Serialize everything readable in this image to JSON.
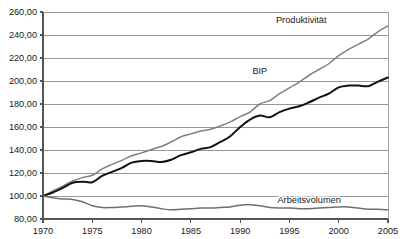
{
  "chart_data": {
    "type": "line",
    "title": "",
    "subtitle": "",
    "xlabel": "",
    "ylabel": "",
    "xlim": [
      1970,
      2005
    ],
    "ylim": [
      80,
      260
    ],
    "grid": true,
    "legend_position": "inline-annotations",
    "y_ticks": [
      80,
      100,
      120,
      140,
      160,
      180,
      200,
      220,
      240,
      260
    ],
    "y_tick_labels": [
      "80,00",
      "100,00",
      "120,00",
      "140,00",
      "160,00",
      "180,00",
      "200,00",
      "220,00",
      "240,00",
      "260,00"
    ],
    "x_ticks": [
      1970,
      1975,
      1980,
      1985,
      1990,
      1995,
      2000,
      2005
    ],
    "x_tick_labels": [
      "1970",
      "1975",
      "1980",
      "1985",
      "1990",
      "1995",
      "2000",
      "2005"
    ],
    "x": [
      1970,
      1971,
      1972,
      1973,
      1974,
      1975,
      1976,
      1977,
      1978,
      1979,
      1980,
      1981,
      1982,
      1983,
      1984,
      1985,
      1986,
      1987,
      1988,
      1989,
      1990,
      1991,
      1992,
      1993,
      1994,
      1995,
      1996,
      1997,
      1998,
      1999,
      2000,
      2001,
      2002,
      2003,
      2004,
      2005
    ],
    "series": [
      {
        "name": "Produktivität",
        "color": "#808080",
        "label_x": 1996.2,
        "label_y": 250.5,
        "values": [
          100.0,
          104.5,
          108.5,
          113.0,
          116.0,
          118.0,
          123.5,
          127.5,
          131.0,
          135.0,
          137.5,
          140.5,
          143.0,
          147.0,
          151.5,
          154.0,
          156.5,
          158.0,
          161.0,
          164.5,
          169.0,
          173.0,
          180.0,
          183.0,
          189.0,
          194.0,
          199.0,
          205.0,
          210.0,
          215.0,
          222.0,
          227.5,
          232.0,
          236.5,
          243.0,
          248.0
        ]
      },
      {
        "name": "BIP",
        "color": "#111111",
        "label_x": 1992.0,
        "label_y": 206.0,
        "values": [
          100.0,
          103.0,
          107.0,
          111.5,
          112.5,
          112.0,
          117.5,
          121.0,
          124.5,
          129.0,
          130.5,
          130.5,
          129.5,
          131.5,
          135.5,
          138.0,
          141.0,
          142.5,
          147.0,
          152.0,
          160.0,
          166.5,
          170.0,
          168.5,
          173.0,
          176.0,
          178.0,
          181.5,
          185.5,
          189.0,
          194.5,
          196.0,
          196.0,
          195.5,
          199.5,
          203.0
        ]
      },
      {
        "name": "Arbeitsvolumen",
        "color": "#6f6f6f",
        "label_x": 1997.0,
        "label_y": 93.5,
        "values": [
          100.0,
          98.5,
          97.5,
          97.0,
          95.0,
          91.5,
          90.0,
          90.0,
          90.5,
          91.0,
          91.5,
          90.5,
          89.0,
          88.0,
          88.5,
          89.0,
          89.5,
          89.5,
          90.0,
          90.5,
          92.0,
          92.5,
          91.5,
          90.0,
          89.5,
          89.5,
          89.0,
          89.0,
          89.5,
          90.0,
          90.5,
          90.5,
          89.5,
          88.5,
          88.5,
          88.0
        ]
      }
    ]
  }
}
